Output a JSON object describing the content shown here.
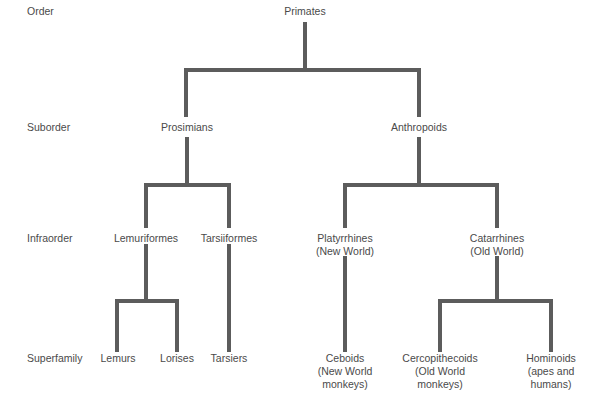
{
  "levels": {
    "order": "Order",
    "suborder": "Suborder",
    "infraorder": "Infraorder",
    "superfamily": "Superfamily"
  },
  "nodes": {
    "primates": "Primates",
    "prosimians": "Prosimians",
    "anthropoids": "Anthropoids",
    "lemuriformes": "Lemuriformes",
    "tarsiiformes": "Tarsiiformes",
    "platyrrhines": [
      "Platyrrhines",
      "(New World)"
    ],
    "catarrhines": [
      "Catarrhines",
      "(Old World)"
    ],
    "lemurs": "Lemurs",
    "lorises": "Lorises",
    "tarsiers": "Tarsiers",
    "ceboids": [
      "Ceboids",
      "(New World",
      "monkeys)"
    ],
    "cercopithecoids": [
      "Cercopithecoids",
      "(Old World",
      "monkeys)"
    ],
    "hominoids": [
      "Hominoids",
      "(apes and",
      "humans)"
    ]
  },
  "colors": {
    "line": "#5c5c5c",
    "text": "#4a4a4a"
  }
}
